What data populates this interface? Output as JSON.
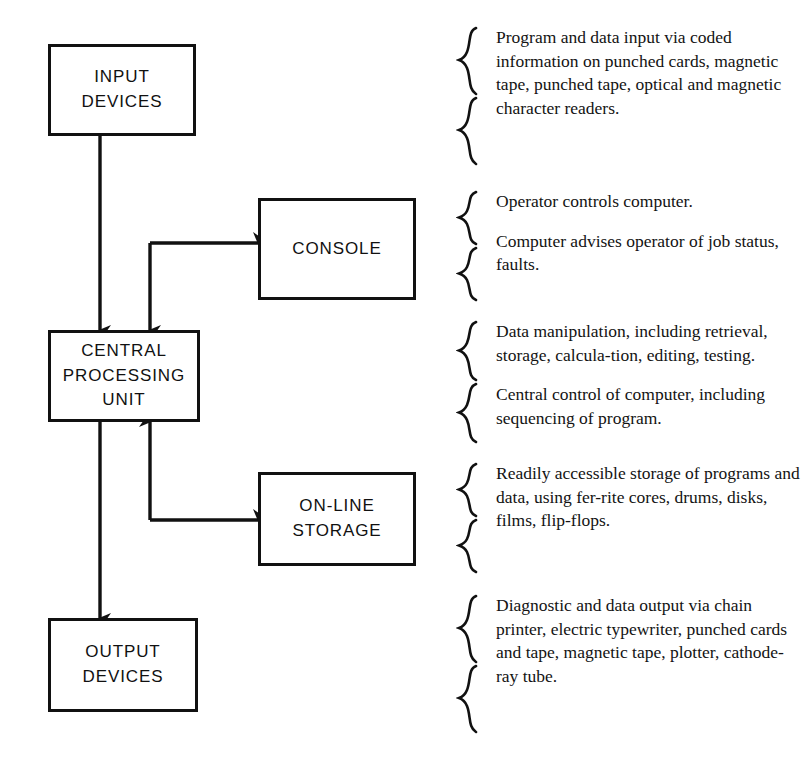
{
  "diagram": {
    "line_color": "#111111",
    "background_color": "#ffffff"
  },
  "nodes": {
    "input": {
      "line1": "INPUT",
      "line2": "DEVICES"
    },
    "cpu": {
      "line1": "CENTRAL",
      "line2": "PROCESSING",
      "line3": "UNIT"
    },
    "output": {
      "line1": "OUTPUT",
      "line2": "DEVICES"
    },
    "console": {
      "line1": "CONSOLE"
    },
    "storage": {
      "line1": "ON-LINE",
      "line2": "STORAGE"
    }
  },
  "annotations": {
    "input": {
      "para1": "Program and data input via coded information on punched cards, magnetic tape, punched tape, optical and magnetic character readers."
    },
    "console": {
      "para1": "Operator controls computer.",
      "para2": "Computer advises operator of job status, faults."
    },
    "cpu": {
      "para1": "Data manipulation, including retrieval, storage, calcula-tion, editing, testing.",
      "para2": "Central control of computer, including sequencing of program."
    },
    "storage": {
      "para1": "Readily accessible storage of programs and data, using fer-rite cores, drums, disks, films, flip-flops."
    },
    "output": {
      "para1": "Diagnostic and data output via chain printer, electric typewriter, punched cards and tape, magnetic tape, plotter, cathode-ray tube."
    }
  },
  "connections": [
    {
      "from": "input",
      "to": "cpu",
      "direction": "down"
    },
    {
      "from": "cpu",
      "to": "console",
      "direction": "right"
    },
    {
      "from": "console",
      "to": "cpu",
      "direction": "down"
    },
    {
      "from": "cpu",
      "to": "storage",
      "direction": "right"
    },
    {
      "from": "storage",
      "to": "cpu",
      "direction": "up"
    },
    {
      "from": "cpu",
      "to": "output",
      "direction": "down"
    }
  ]
}
